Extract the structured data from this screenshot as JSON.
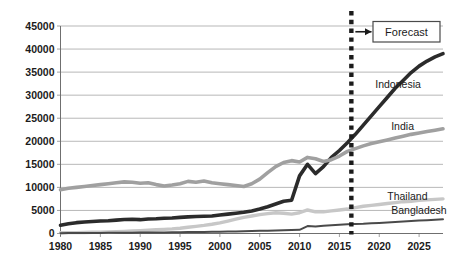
{
  "chart_data": {
    "type": "line",
    "title": "",
    "xlabel": "",
    "ylabel": "",
    "xlim": [
      1980,
      2028
    ],
    "ylim": [
      0,
      45000
    ],
    "grid": true,
    "legend_position": "inline-right",
    "yticks": [
      "0",
      "5000",
      "10000",
      "15000",
      "20000",
      "25000",
      "30000",
      "35000",
      "40000",
      "45000"
    ],
    "ytick_values": [
      0,
      5000,
      10000,
      15000,
      20000,
      25000,
      30000,
      35000,
      40000,
      45000
    ],
    "xticks": [
      "1980",
      "1985",
      "1990",
      "1995",
      "2000",
      "2005",
      "2010",
      "2015",
      "2020",
      "2025"
    ],
    "xtick_values": [
      1980,
      1985,
      1990,
      1995,
      2000,
      2005,
      2010,
      2015,
      2020,
      2025
    ],
    "x": [
      1980,
      1981,
      1982,
      1983,
      1984,
      1985,
      1986,
      1987,
      1988,
      1989,
      1990,
      1991,
      1992,
      1993,
      1994,
      1995,
      1996,
      1997,
      1998,
      1999,
      2000,
      2001,
      2002,
      2003,
      2004,
      2005,
      2006,
      2007,
      2008,
      2009,
      2010,
      2011,
      2012,
      2013,
      2014,
      2015,
      2016,
      2017,
      2018,
      2019,
      2020,
      2021,
      2022,
      2023,
      2024,
      2025,
      2026,
      2027,
      2028
    ],
    "series": [
      {
        "name": "Indonesia",
        "color": "#2b2b2b",
        "width": 3.6,
        "label_x": 2019.5,
        "label_y": 31500,
        "values": [
          1800,
          2100,
          2350,
          2500,
          2600,
          2700,
          2750,
          2900,
          3050,
          3100,
          3000,
          3150,
          3200,
          3300,
          3350,
          3500,
          3600,
          3700,
          3750,
          3800,
          4000,
          4200,
          4400,
          4600,
          4900,
          5300,
          5800,
          6400,
          7000,
          7200,
          12500,
          15000,
          13000,
          14500,
          16500,
          18000,
          19700,
          21500,
          23500,
          25500,
          27500,
          29500,
          31500,
          33200,
          34900,
          36300,
          37400,
          38300,
          39000
        ]
      },
      {
        "name": "India",
        "color": "#a0a0a0",
        "width": 3.6,
        "label_x": 2021.5,
        "label_y": 22500,
        "values": [
          9500,
          9800,
          10000,
          10200,
          10400,
          10600,
          10800,
          11000,
          11200,
          11100,
          10900,
          11000,
          10600,
          10300,
          10500,
          10800,
          11300,
          11100,
          11400,
          11000,
          10800,
          10600,
          10400,
          10200,
          10800,
          11800,
          13200,
          14500,
          15400,
          15800,
          15500,
          16500,
          16200,
          15600,
          16000,
          16800,
          17800,
          18400,
          19000,
          19500,
          19900,
          20300,
          20700,
          21100,
          21500,
          21800,
          22100,
          22400,
          22700
        ]
      },
      {
        "name": "Thailand",
        "color": "#c7c7c7",
        "width": 3.4,
        "label_x": 2021.0,
        "label_y": 7300,
        "values": [
          150,
          180,
          200,
          230,
          260,
          300,
          340,
          400,
          470,
          540,
          620,
          700,
          800,
          900,
          1000,
          1150,
          1350,
          1550,
          1750,
          2000,
          2300,
          2700,
          3100,
          3500,
          3800,
          4100,
          4300,
          4500,
          4400,
          4200,
          4500,
          5100,
          4700,
          4700,
          4900,
          5100,
          5300,
          5600,
          5900,
          6100,
          6300,
          6500,
          6700,
          6900,
          7000,
          7200,
          7300,
          7400,
          7500
        ]
      },
      {
        "name": "Bangladesh",
        "color": "#4a4a4a",
        "width": 2.0,
        "label_x": 2021.5,
        "label_y": 4200,
        "values": [
          80,
          90,
          100,
          110,
          120,
          130,
          140,
          150,
          160,
          175,
          190,
          205,
          220,
          240,
          260,
          280,
          300,
          320,
          345,
          370,
          400,
          430,
          460,
          500,
          540,
          580,
          620,
          660,
          700,
          740,
          800,
          1600,
          1500,
          1700,
          1800,
          1900,
          2000,
          2050,
          2100,
          2200,
          2300,
          2400,
          2500,
          2600,
          2700,
          2800,
          2900,
          3000,
          3100
        ]
      }
    ],
    "annotations": {
      "forecast_line_x": 2016.5,
      "forecast_box_label": "Forecast",
      "forecast_box_color": "#4a4a4a",
      "forecast_line_color": "#1b1b1b",
      "arrow_label": "forecast-arrow"
    }
  }
}
